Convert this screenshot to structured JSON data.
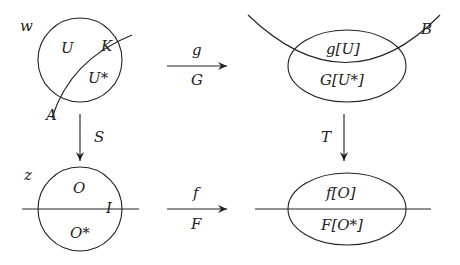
{
  "diagram": {
    "top_left": {
      "space_label": "w",
      "region_upper": "U",
      "region_lower": "U*",
      "curve_label_start": "A",
      "curve_label_end": "K"
    },
    "top_arrow": {
      "upper_label": "g",
      "lower_label": "G"
    },
    "top_right": {
      "curve_label": "B",
      "region_upper": "g[U]",
      "region_lower": "G[U*]"
    },
    "left_arrow": {
      "label": "S"
    },
    "right_arrow": {
      "label": "T"
    },
    "bottom_left": {
      "space_label": "z",
      "region_upper": "O",
      "region_lower": "O*",
      "line_label": "I"
    },
    "bottom_arrow": {
      "upper_label": "f",
      "lower_label": "F"
    },
    "bottom_right": {
      "region_upper": "f[O]",
      "region_lower": "F[O*]"
    },
    "colors": {
      "ink": "#222222",
      "background": "#ffffff"
    }
  }
}
